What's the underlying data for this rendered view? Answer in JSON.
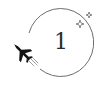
{
  "badge": {
    "number": "1",
    "colors": {
      "ring": "#6e6e6e",
      "plane": "#141414",
      "sparkle": "#7a7a7a",
      "text": "#2a2a2a",
      "background": "#ffffff"
    }
  },
  "icons": {
    "plane": "airplane-icon",
    "sparkles": "sparkle-icon",
    "ring": "orbit-ring"
  }
}
